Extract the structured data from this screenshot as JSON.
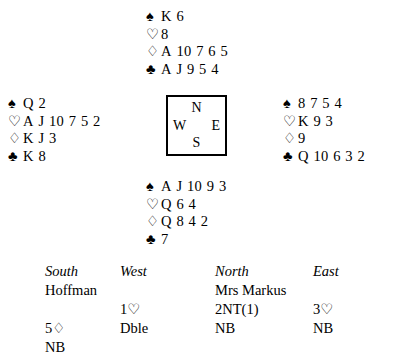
{
  "diagram": {
    "type": "bridge-hand-diagram",
    "compass": {
      "north": "N",
      "south": "S",
      "east": "E",
      "west": "W"
    },
    "suit_symbols": {
      "spade": "♠",
      "heart": "♡",
      "diamond": "♢",
      "club": "♣"
    },
    "hands": {
      "north": {
        "label": "North",
        "spades": "K 6",
        "hearts": "8",
        "diamonds": "A 10 7 6 5",
        "clubs": "A J 9 5 4"
      },
      "west": {
        "label": "West",
        "spades": "Q 2",
        "hearts": "A J 10 7 5 2",
        "diamonds": "K J 3",
        "clubs": "K 8"
      },
      "east": {
        "label": "East",
        "spades": "8 7 5 4",
        "hearts": "K 9 3",
        "diamonds": "9",
        "clubs": "Q 10 6 3 2"
      },
      "south": {
        "label": "South",
        "spades": "A J 10 9 3",
        "hearts": "Q 6 4",
        "diamonds": "Q 8 4 2",
        "clubs": "7"
      }
    }
  },
  "bidding": {
    "headers": {
      "south": "South",
      "west": "West",
      "north": "North",
      "east": "East"
    },
    "players": {
      "south": "Hoffman",
      "west": "",
      "north": "Mrs Markus",
      "east": ""
    },
    "rounds": [
      {
        "south": "",
        "west": "1♡",
        "north": "2NT(1)",
        "east": "3♡"
      },
      {
        "south": "5♢",
        "west": "Dble",
        "north": "NB",
        "east": "NB"
      },
      {
        "south": "NB",
        "west": "",
        "north": "",
        "east": ""
      }
    ]
  }
}
